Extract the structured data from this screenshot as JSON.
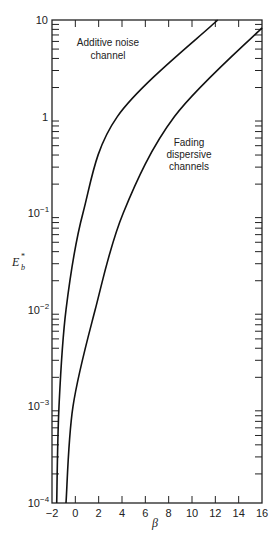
{
  "chart_data": {
    "type": "line",
    "title": "",
    "xlabel": "β",
    "ylabel": "E_b*",
    "ylabel_main": "E",
    "ylabel_sub": "b",
    "ylabel_sup": "*",
    "xlim": [
      -2,
      16
    ],
    "ylim": [
      0.0001,
      10
    ],
    "yscale": "log",
    "grid": false,
    "x_ticks": [
      -2,
      0,
      2,
      4,
      6,
      8,
      10,
      12,
      14,
      16
    ],
    "x_tick_labels": [
      "−2",
      "0",
      "2",
      "4",
      "6",
      "8",
      "10",
      "12",
      "14",
      "16"
    ],
    "y_ticks": [
      0.0001,
      0.001,
      0.01,
      0.1,
      1,
      10
    ],
    "y_tick_labels": [
      {
        "base": "10",
        "exp": "−4"
      },
      {
        "base": "10",
        "exp": "−3"
      },
      {
        "base": "10",
        "exp": "−2"
      },
      {
        "base": "10",
        "exp": "−1"
      },
      {
        "base": "1",
        "exp": ""
      },
      {
        "base": "10",
        "exp": ""
      }
    ],
    "series": [
      {
        "name": "Additive noise channel",
        "label_lines": [
          "Additive noise",
          "channel"
        ],
        "x": [
          -1.6,
          -1.4,
          -0.8,
          0.65,
          3.6,
          12.2
        ],
        "y": [
          0.0001,
          0.001,
          0.01,
          0.1,
          1,
          10
        ]
      },
      {
        "name": "Fading dispersive channels",
        "label_lines": [
          "Fading",
          "dispersive",
          "channels"
        ],
        "x": [
          -0.8,
          -0.2,
          1.7,
          4.1,
          8.5,
          16
        ],
        "y": [
          0.0001,
          0.001,
          0.01,
          0.1,
          1,
          8.3
        ]
      }
    ]
  }
}
